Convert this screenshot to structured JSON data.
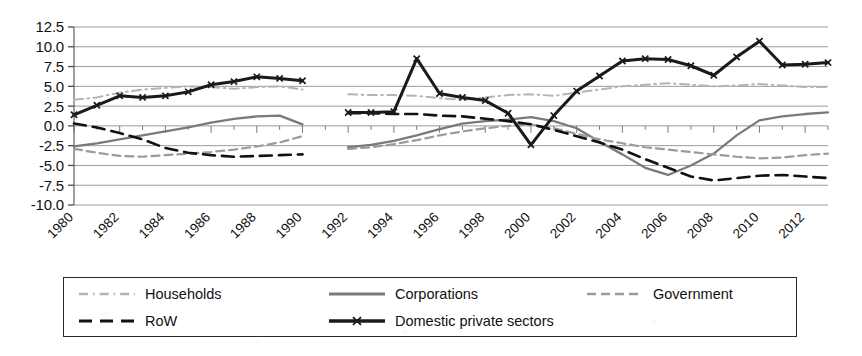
{
  "chart_data": {
    "type": "line",
    "title": "",
    "subtitle": "",
    "xlabel": "",
    "ylabel": "",
    "xlim": [
      1980,
      2013
    ],
    "ylim": [
      -10.0,
      12.5
    ],
    "grid": true,
    "legend_position": "bottom",
    "x": [
      1980,
      1981,
      1982,
      1983,
      1984,
      1985,
      1986,
      1987,
      1988,
      1989,
      1990,
      1991,
      1992,
      1993,
      1994,
      1995,
      1996,
      1997,
      1998,
      1999,
      2000,
      2001,
      2002,
      2003,
      2004,
      2005,
      2006,
      2007,
      2008,
      2009,
      2010,
      2011,
      2012,
      2013
    ],
    "y_ticks": [
      -10.0,
      -7.5,
      -5.0,
      -2.5,
      0.0,
      2.5,
      5.0,
      7.5,
      10.0,
      12.5
    ],
    "y_tick_labels": [
      "-10.0",
      "-7.5",
      "-5.0",
      "-2.5",
      "0.0",
      "2.5",
      "5.0",
      "7.5",
      "10.0",
      "12.5"
    ],
    "x_ticks": [
      1980,
      1982,
      1984,
      1986,
      1988,
      1990,
      1992,
      1994,
      1996,
      1998,
      2000,
      2002,
      2004,
      2006,
      2008,
      2010,
      2012
    ],
    "x_tick_labels": [
      "1980",
      "1982",
      "1984",
      "1986",
      "1988",
      "1990",
      "1992",
      "1994",
      "1996",
      "1998",
      "2000",
      "2002",
      "2004",
      "2006",
      "2008",
      "2010",
      "2012"
    ],
    "break_between": [
      1990,
      1991
    ],
    "series": [
      {
        "name": "Households",
        "style": "dashdot",
        "color": "#b4b4b4",
        "width": 2.0,
        "marker": "none",
        "x": [
          1980,
          1981,
          1982,
          1983,
          1984,
          1985,
          1986,
          1987,
          1988,
          1989,
          1990,
          1991,
          1992,
          1993,
          1994,
          1995,
          1996,
          1997,
          1998,
          1999,
          2000,
          2001,
          2002,
          2003,
          2004,
          2005,
          2006,
          2007,
          2008,
          2009,
          2010,
          2011,
          2012,
          2013
        ],
        "values": [
          3.3,
          3.6,
          4.2,
          4.6,
          4.8,
          5.0,
          4.9,
          4.7,
          4.9,
          5.0,
          4.6,
          null,
          4.0,
          3.9,
          3.9,
          3.8,
          3.5,
          3.3,
          3.6,
          3.9,
          4.0,
          3.8,
          4.2,
          4.6,
          5.0,
          5.2,
          5.4,
          5.2,
          5.0,
          5.1,
          5.3,
          5.1,
          4.9,
          4.9
        ]
      },
      {
        "name": "Corporations",
        "style": "solid",
        "color": "#7a7a7a",
        "width": 2.3,
        "marker": "none",
        "x": [
          1980,
          1981,
          1982,
          1983,
          1984,
          1985,
          1986,
          1987,
          1988,
          1989,
          1990,
          1991,
          1992,
          1993,
          1994,
          1995,
          1996,
          1997,
          1998,
          1999,
          2000,
          2001,
          2002,
          2003,
          2004,
          2005,
          2006,
          2007,
          2008,
          2009,
          2010,
          2011,
          2012,
          2013
        ],
        "values": [
          -2.6,
          -2.2,
          -1.7,
          -1.2,
          -0.7,
          -0.2,
          0.4,
          0.9,
          1.2,
          1.3,
          0.2,
          null,
          -2.7,
          -2.4,
          -1.9,
          -1.2,
          -0.4,
          0.3,
          0.6,
          0.8,
          1.1,
          0.6,
          -0.3,
          -2.0,
          -3.6,
          -5.3,
          -6.2,
          -5.0,
          -3.5,
          -1.2,
          0.7,
          1.2,
          1.5,
          1.7
        ]
      },
      {
        "name": "Government",
        "style": "dashed",
        "color": "#9b9b9b",
        "width": 2.2,
        "marker": "none",
        "x": [
          1980,
          1981,
          1982,
          1983,
          1984,
          1985,
          1986,
          1987,
          1988,
          1989,
          1990,
          1991,
          1992,
          1993,
          1994,
          1995,
          1996,
          1997,
          1998,
          1999,
          2000,
          2001,
          2002,
          2003,
          2004,
          2005,
          2006,
          2007,
          2008,
          2009,
          2010,
          2011,
          2012,
          2013
        ],
        "values": [
          -2.9,
          -3.4,
          -3.8,
          -3.9,
          -3.7,
          -3.5,
          -3.3,
          -3.0,
          -2.6,
          -2.1,
          -1.3,
          null,
          -2.9,
          -2.7,
          -2.3,
          -1.8,
          -1.2,
          -0.7,
          -0.3,
          0.0,
          0.2,
          -0.3,
          -1.0,
          -1.7,
          -2.2,
          -2.7,
          -3.0,
          -3.3,
          -3.6,
          -3.9,
          -4.1,
          -4.0,
          -3.7,
          -3.5
        ]
      },
      {
        "name": "RoW",
        "style": "longdash",
        "color": "#111111",
        "width": 2.6,
        "marker": "none",
        "x": [
          1980,
          1981,
          1982,
          1983,
          1984,
          1985,
          1986,
          1987,
          1988,
          1989,
          1990,
          1991,
          1992,
          1993,
          1994,
          1995,
          1996,
          1997,
          1998,
          1999,
          2000,
          2001,
          2002,
          2003,
          2004,
          2005,
          2006,
          2007,
          2008,
          2009,
          2010,
          2011,
          2012,
          2013
        ],
        "values": [
          0.3,
          -0.2,
          -0.9,
          -1.7,
          -2.8,
          -3.4,
          -3.7,
          -3.9,
          -3.8,
          -3.7,
          -3.6,
          null,
          1.6,
          1.6,
          1.5,
          1.5,
          1.3,
          1.2,
          0.9,
          0.6,
          0.2,
          -0.5,
          -1.3,
          -2.1,
          -3.0,
          -4.2,
          -5.3,
          -6.4,
          -6.9,
          -6.6,
          -6.3,
          -6.2,
          -6.4,
          -6.6
        ]
      },
      {
        "name": "Domestic private sectors",
        "style": "solid",
        "color": "#1a1a1a",
        "width": 3.0,
        "marker": "cross",
        "x": [
          1980,
          1981,
          1982,
          1983,
          1984,
          1985,
          1986,
          1987,
          1988,
          1989,
          1990,
          1991,
          1992,
          1993,
          1994,
          1995,
          1996,
          1997,
          1998,
          1999,
          2000,
          2001,
          2002,
          2003,
          2004,
          2005,
          2006,
          2007,
          2008,
          2009,
          2010,
          2011,
          2012,
          2013
        ],
        "values": [
          1.4,
          2.6,
          3.8,
          3.6,
          3.8,
          4.3,
          5.2,
          5.6,
          6.2,
          6.0,
          5.7,
          null,
          1.7,
          1.7,
          1.8,
          8.5,
          4.1,
          3.6,
          3.2,
          1.6,
          -2.4,
          1.3,
          4.4,
          6.3,
          8.2,
          8.5,
          8.4,
          7.6,
          6.4,
          8.7,
          10.7,
          7.7,
          7.8,
          8.0
        ]
      }
    ]
  },
  "legend": {
    "items": [
      {
        "label": "Households",
        "swatch": "dashdot-light"
      },
      {
        "label": "Corporations",
        "swatch": "solid-gray"
      },
      {
        "label": "Government",
        "swatch": "dashed-gray"
      },
      {
        "label": "RoW",
        "swatch": "longdash-black"
      },
      {
        "label": "Domestic private sectors",
        "swatch": "solid-black-marker"
      }
    ]
  }
}
